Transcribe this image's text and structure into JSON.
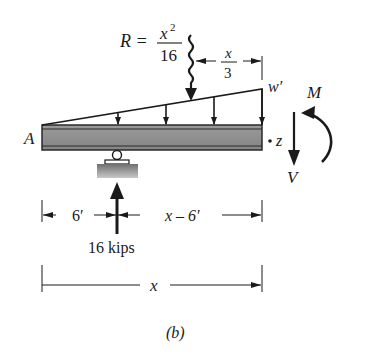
{
  "figure": {
    "caption": "(b)",
    "beam": {
      "left_end_label": "A",
      "right_end_point_label": "z",
      "fill_color": "#8f8f8f",
      "edge_color": "#2a2a2a"
    },
    "distributed_load": {
      "shape": "triangular",
      "end_intensity_label": "w′",
      "arrow_count": 4
    },
    "resultant": {
      "label_lhs": "R =",
      "numerator_var": "x",
      "numerator_exp": "2",
      "denominator": "16",
      "position_dim": {
        "numerator": "x",
        "denominator": "3"
      }
    },
    "support": {
      "type": "roller",
      "reaction_label": "16 kips"
    },
    "internal_forces": {
      "moment_label": "M",
      "shear_label": "V"
    },
    "dimensions": {
      "left_segment": "6′",
      "right_segment": "x – 6′",
      "total": "x"
    }
  }
}
